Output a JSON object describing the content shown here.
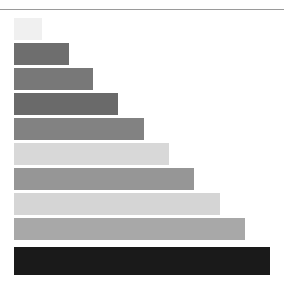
{
  "figure": {
    "background_color": "#ffffff",
    "width": 284,
    "height": 294,
    "rule_color": "#9a9a9a"
  },
  "chart_data": {
    "type": "bar",
    "orientation": "horizontal",
    "title": "",
    "subtitle": "",
    "xlabel": "",
    "ylabel": "",
    "grid": false,
    "legend": null,
    "axis_visible": false,
    "tick_labels_visible": false,
    "categories": [
      "1",
      "2",
      "3",
      "4",
      "5",
      "6",
      "7",
      "8",
      "9",
      "10"
    ],
    "values": [
      28,
      55,
      79,
      104,
      130,
      155,
      180,
      206,
      231,
      256
    ],
    "xlim": [
      0,
      270
    ],
    "ylim": [
      0,
      10
    ],
    "bar_colors": [
      "#f0f0f0",
      "#6e6e6e",
      "#787878",
      "#6a6a6a",
      "#828282",
      "#d8d8d8",
      "#969696",
      "#d5d5d5",
      "#a8a8a8",
      "#1a1a1a"
    ],
    "bars": [
      {
        "index": 1,
        "value": 28,
        "color": "#f0f0f0",
        "x": 14,
        "y": 18,
        "width": 28,
        "height": 22
      },
      {
        "index": 2,
        "value": 55,
        "color": "#6e6e6e",
        "x": 14,
        "y": 43,
        "width": 55,
        "height": 22
      },
      {
        "index": 3,
        "value": 79,
        "color": "#787878",
        "x": 14,
        "y": 68,
        "width": 79,
        "height": 22
      },
      {
        "index": 4,
        "value": 104,
        "color": "#6a6a6a",
        "x": 14,
        "y": 93,
        "width": 104,
        "height": 22
      },
      {
        "index": 5,
        "value": 130,
        "color": "#828282",
        "x": 14,
        "y": 118,
        "width": 130,
        "height": 22
      },
      {
        "index": 6,
        "value": 155,
        "color": "#d8d8d8",
        "x": 14,
        "y": 143,
        "width": 155,
        "height": 22
      },
      {
        "index": 7,
        "value": 180,
        "color": "#969696",
        "x": 14,
        "y": 168,
        "width": 180,
        "height": 22
      },
      {
        "index": 8,
        "value": 206,
        "color": "#d5d5d5",
        "x": 14,
        "y": 193,
        "width": 206,
        "height": 22
      },
      {
        "index": 9,
        "value": 231,
        "color": "#a8a8a8",
        "x": 14,
        "y": 218,
        "width": 231,
        "height": 22
      },
      {
        "index": 10,
        "value": 256,
        "color": "#1a1a1a",
        "x": 14,
        "y": 247,
        "width": 256,
        "height": 28
      }
    ]
  }
}
